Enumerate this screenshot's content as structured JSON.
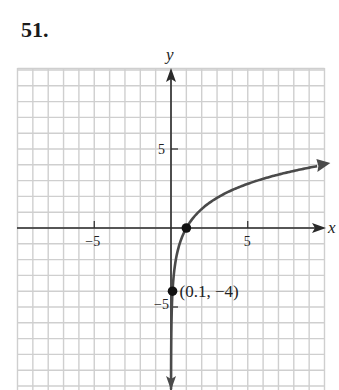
{
  "problem": {
    "number": "51."
  },
  "chart_data": {
    "type": "line",
    "title": "",
    "xlabel": "x",
    "ylabel": "y",
    "xlim": [
      -10,
      10
    ],
    "ylim": [
      -10,
      10
    ],
    "grid": true,
    "x_ticks": [
      {
        "value": -5,
        "label": "−5"
      },
      {
        "value": 5,
        "label": "5"
      }
    ],
    "y_ticks": [
      {
        "value": 5,
        "label": "5"
      },
      {
        "value": -5,
        "label": "−5"
      }
    ],
    "series": [
      {
        "name": "y = log-shaped curve",
        "description": "Logarithmic curve with vertical asymptote at x = 0, decreasing without bound as x→0+, increasing slowly to the right",
        "x": [
          0.02,
          0.05,
          0.1,
          0.3,
          0.5,
          1,
          2,
          3,
          4,
          6,
          8,
          10
        ],
        "y": [
          -10,
          -7,
          -4,
          -1.5,
          -0.7,
          0,
          1.5,
          2.2,
          2.7,
          3.4,
          3.9,
          4.3
        ]
      }
    ],
    "points": [
      {
        "x": 1,
        "y": 0,
        "label": ""
      },
      {
        "x": 0.1,
        "y": -4,
        "label": "(0.1, −4)"
      }
    ],
    "colors": {
      "curve": "#4a4a4a",
      "axes": "#2a2a2a",
      "grid": "#cfcfcf"
    }
  }
}
